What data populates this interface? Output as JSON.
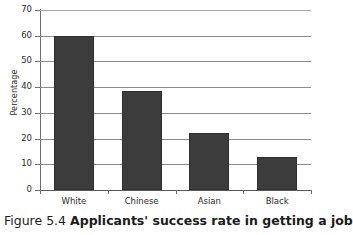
{
  "figure": {
    "caption_number": "Figure 5.4",
    "caption_text": "Applicants' success rate in getting a job"
  },
  "chart_data": {
    "type": "bar",
    "title": "",
    "xlabel": "",
    "ylabel": "Percentage",
    "categories": [
      "White",
      "Chinese",
      "Asian",
      "Black"
    ],
    "values": [
      60,
      38.5,
      22,
      13
    ],
    "ylim": [
      0,
      70
    ],
    "ytick_labels": [
      "0",
      "10",
      "20",
      "30",
      "40",
      "50",
      "60",
      "70"
    ],
    "ytick_values": [
      0,
      10,
      20,
      30,
      40,
      50,
      60,
      70
    ],
    "grid": true,
    "legend": false,
    "bar_color": "#3c3c3c",
    "gridline_color": "#8d8d8d",
    "axis_color": "#6e6e6e"
  }
}
